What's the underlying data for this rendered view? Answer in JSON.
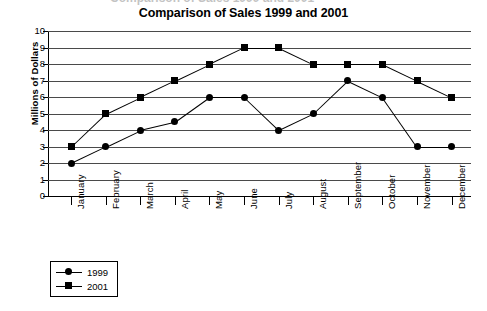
{
  "title": "Comparison of Sales 1999 and 2001",
  "cut_off_text": "Comparison of Sales 1999 and 2001",
  "axes": {
    "ylabel": "Millions of Dollars",
    "xlabel": "",
    "yticks": [
      "0",
      "1",
      "2",
      "3",
      "4",
      "5",
      "6",
      "7",
      "8",
      "9",
      "10"
    ]
  },
  "legend": {
    "position": "bottom-left",
    "entries": [
      {
        "label": "1999",
        "marker": "circle",
        "color": "#000000"
      },
      {
        "label": "2001",
        "marker": "square",
        "color": "#000000"
      }
    ]
  },
  "colors": {
    "line": "#000000",
    "grid": "#4a4a4a",
    "axis": "#000000",
    "background": "#ffffff"
  },
  "chart_data": {
    "type": "line",
    "title": "Comparison of Sales 1999 and 2001",
    "xlabel": "",
    "ylabel": "Millions of Dollars",
    "ylim": [
      0,
      10
    ],
    "ytick_step": 1,
    "grid": true,
    "legend_position": "bottom-left",
    "categories": [
      "January",
      "February",
      "March",
      "April",
      "May",
      "June",
      "July",
      "August",
      "September",
      "October",
      "November",
      "December"
    ],
    "series": [
      {
        "name": "1999",
        "marker": "circle",
        "values": [
          2,
          3,
          4,
          4.5,
          6,
          6,
          4,
          5,
          7,
          6,
          3,
          3
        ]
      },
      {
        "name": "2001",
        "marker": "square",
        "values": [
          3,
          5,
          6,
          7,
          8,
          9,
          9,
          8,
          8,
          8,
          7,
          6
        ]
      }
    ]
  }
}
